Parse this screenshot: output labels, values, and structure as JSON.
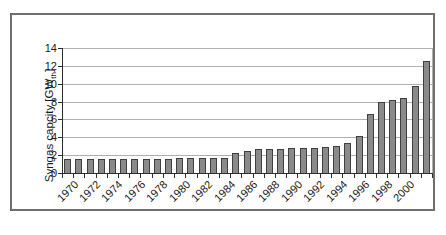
{
  "chart_data": {
    "type": "bar",
    "title": "",
    "ylabel_main": "Syngas capcity [GW",
    "ylabel_sub": "th",
    "ylabel_close": "]",
    "xlabel": "",
    "categories": [
      1970,
      1971,
      1972,
      1973,
      1974,
      1975,
      1976,
      1977,
      1978,
      1979,
      1980,
      1981,
      1982,
      1983,
      1984,
      1985,
      1986,
      1987,
      1988,
      1989,
      1990,
      1991,
      1992,
      1993,
      1994,
      1995,
      1996,
      1997,
      1998,
      1999,
      2000,
      2001,
      2002
    ],
    "values": [
      1.6,
      1.6,
      1.6,
      1.6,
      1.6,
      1.6,
      1.6,
      1.6,
      1.6,
      1.6,
      1.65,
      1.65,
      1.65,
      1.65,
      1.7,
      2.2,
      2.45,
      2.65,
      2.65,
      2.65,
      2.75,
      2.75,
      2.75,
      2.9,
      3.0,
      3.4,
      4.2,
      6.6,
      8.0,
      8.2,
      8.4,
      9.8,
      12.6
    ],
    "x_tick_labels": [
      "1970",
      "1972",
      "1974",
      "1976",
      "1978",
      "1980",
      "1982",
      "1984",
      "1986",
      "1988",
      "1990",
      "1992",
      "1994",
      "1996",
      "1998",
      "2000"
    ],
    "x_tick_every": 2,
    "y_ticks": [
      0,
      2,
      4,
      6,
      8,
      10,
      12,
      14
    ],
    "ylim": [
      0,
      14
    ],
    "grid": "horizontal",
    "legend": "none",
    "colors": {
      "bar_fill": "#8a8a8a",
      "bar_border": "#3f3f3f",
      "gridline": "#b0b0b0",
      "axis": "#2e2e2e",
      "frame_border": "#6f6f6f",
      "text": "#1a1a1a",
      "background": "#ffffff"
    }
  }
}
